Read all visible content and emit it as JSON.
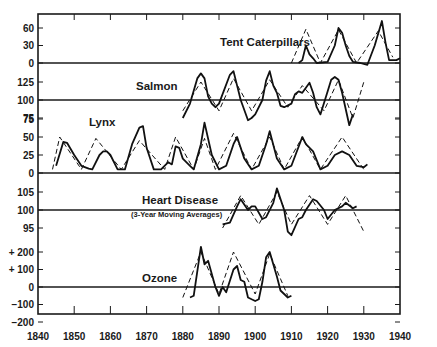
{
  "chart_data": {
    "type": "line",
    "title": "",
    "xlabel": "",
    "ylabel": "",
    "x_axis": {
      "range": [
        1840,
        1940
      ],
      "ticks": [
        1840,
        1850,
        1860,
        1870,
        1880,
        1890,
        1900,
        1910,
        1920,
        1930,
        1940
      ],
      "tick_labels": [
        "1840",
        "1850",
        "1860",
        "1870",
        "1880",
        "1890",
        "1900",
        "1910",
        "1920",
        "1930",
        "1940"
      ]
    },
    "grid": false,
    "legend": null,
    "line_styles": {
      "solid": "observed series",
      "dashed": "idealized cycle"
    },
    "panels": [
      {
        "name": "Tent Caterpillars",
        "label": "Tent Caterpillars",
        "y_ticks": [
          0,
          30,
          60
        ],
        "y_tick_labels": [
          "0",
          "30",
          "60"
        ],
        "baseline": 0,
        "series": [
          {
            "name": "observed",
            "style": "solid",
            "points": [
              [
                1912,
                0
              ],
              [
                1913,
                5
              ],
              [
                1914,
                30
              ],
              [
                1915,
                15
              ],
              [
                1916,
                8
              ],
              [
                1917,
                0
              ],
              [
                1920,
                2
              ],
              [
                1922,
                30
              ],
              [
                1923,
                60
              ],
              [
                1924,
                52
              ],
              [
                1925,
                30
              ],
              [
                1926,
                12
              ],
              [
                1927,
                2
              ],
              [
                1929,
                0
              ],
              [
                1931,
                -3
              ],
              [
                1933,
                30
              ],
              [
                1935,
                72
              ],
              [
                1936,
                35
              ],
              [
                1937,
                5
              ],
              [
                1939,
                5
              ],
              [
                1940,
                8
              ]
            ]
          },
          {
            "name": "cycle",
            "style": "dashed",
            "points": [
              [
                1910,
                0
              ],
              [
                1914,
                58
              ],
              [
                1918,
                0
              ],
              [
                1923,
                57
              ],
              [
                1928,
                0
              ],
              [
                1934,
                55
              ],
              [
                1938,
                10
              ]
            ]
          }
        ]
      },
      {
        "name": "Salmon",
        "label": "Salmon",
        "y_ticks": [
          75,
          100,
          125
        ],
        "y_tick_labels": [
          "75",
          "100",
          "125"
        ],
        "baseline": 100,
        "series": [
          {
            "name": "observed",
            "style": "solid",
            "points": [
              [
                1880,
                75
              ],
              [
                1882,
                95
              ],
              [
                1884,
                130
              ],
              [
                1885,
                137
              ],
              [
                1886,
                130
              ],
              [
                1887,
                105
              ],
              [
                1888,
                95
              ],
              [
                1889,
                90
              ],
              [
                1890,
                95
              ],
              [
                1893,
                135
              ],
              [
                1894,
                140
              ],
              [
                1895,
                120
              ],
              [
                1896,
                100
              ],
              [
                1898,
                72
              ],
              [
                1899,
                75
              ],
              [
                1900,
                80
              ],
              [
                1902,
                100
              ],
              [
                1903,
                127
              ],
              [
                1904,
                140
              ],
              [
                1905,
                120
              ],
              [
                1906,
                110
              ],
              [
                1907,
                92
              ],
              [
                1908,
                90
              ],
              [
                1910,
                95
              ],
              [
                1911,
                108
              ],
              [
                1912,
                112
              ],
              [
                1913,
                110
              ],
              [
                1914,
                117
              ],
              [
                1915,
                124
              ],
              [
                1916,
                110
              ],
              [
                1917,
                90
              ],
              [
                1918,
                80
              ],
              [
                1920,
                112
              ],
              [
                1921,
                128
              ],
              [
                1922,
                132
              ],
              [
                1923,
                128
              ],
              [
                1924,
                110
              ],
              [
                1926,
                65
              ],
              [
                1927,
                80
              ]
            ]
          },
          {
            "name": "cycle",
            "style": "dashed",
            "points": [
              [
                1880,
                85
              ],
              [
                1885,
                125
              ],
              [
                1890,
                85
              ],
              [
                1894,
                130
              ],
              [
                1899,
                85
              ],
              [
                1904,
                128
              ],
              [
                1909,
                90
              ],
              [
                1913,
                120
              ],
              [
                1919,
                85
              ],
              [
                1923,
                128
              ],
              [
                1927,
                75
              ],
              [
                1930,
                125
              ]
            ]
          }
        ]
      },
      {
        "name": "Lynx",
        "label": "Lynx",
        "y_ticks": [
          0,
          25,
          50,
          75
        ],
        "y_tick_labels": [
          "0",
          "25",
          "50",
          "75"
        ],
        "baseline": 0,
        "series": [
          {
            "name": "observed",
            "style": "solid",
            "points": [
              [
                1845,
                10
              ],
              [
                1847,
                43
              ],
              [
                1848,
                42
              ],
              [
                1850,
                25
              ],
              [
                1852,
                10
              ],
              [
                1854,
                6
              ],
              [
                1855,
                5
              ],
              [
                1857,
                25
              ],
              [
                1858,
                30
              ],
              [
                1859,
                30
              ],
              [
                1860,
                25
              ],
              [
                1862,
                5
              ],
              [
                1864,
                5
              ],
              [
                1866,
                40
              ],
              [
                1868,
                63
              ],
              [
                1869,
                65
              ],
              [
                1870,
                35
              ],
              [
                1872,
                5
              ],
              [
                1874,
                5
              ],
              [
                1876,
                15
              ],
              [
                1877,
                12
              ],
              [
                1878,
                37
              ],
              [
                1879,
                35
              ],
              [
                1880,
                20
              ],
              [
                1882,
                10
              ],
              [
                1883,
                5
              ],
              [
                1885,
                40
              ],
              [
                1886,
                70
              ],
              [
                1888,
                25
              ],
              [
                1890,
                5
              ],
              [
                1892,
                10
              ],
              [
                1894,
                40
              ],
              [
                1895,
                50
              ],
              [
                1897,
                20
              ],
              [
                1899,
                5
              ],
              [
                1901,
                10
              ],
              [
                1903,
                40
              ],
              [
                1904,
                58
              ],
              [
                1906,
                20
              ],
              [
                1908,
                5
              ],
              [
                1910,
                10
              ],
              [
                1913,
                50
              ],
              [
                1914,
                40
              ],
              [
                1916,
                30
              ],
              [
                1918,
                5
              ],
              [
                1920,
                10
              ],
              [
                1922,
                25
              ],
              [
                1924,
                30
              ],
              [
                1926,
                25
              ],
              [
                1928,
                10
              ],
              [
                1930,
                8
              ],
              [
                1931,
                12
              ]
            ]
          },
          {
            "name": "cycle",
            "style": "dashed",
            "points": [
              [
                1844,
                5
              ],
              [
                1846,
                50
              ],
              [
                1852,
                5
              ],
              [
                1856,
                48
              ],
              [
                1863,
                5
              ],
              [
                1868,
                45
              ],
              [
                1875,
                5
              ],
              [
                1878,
                50
              ],
              [
                1883,
                5
              ],
              [
                1886,
                48
              ],
              [
                1889,
                5
              ],
              [
                1894,
                55
              ],
              [
                1899,
                5
              ],
              [
                1904,
                50
              ],
              [
                1908,
                5
              ],
              [
                1913,
                50
              ],
              [
                1918,
                5
              ],
              [
                1924,
                50
              ],
              [
                1930,
                5
              ]
            ]
          }
        ]
      },
      {
        "name": "Heart Disease",
        "label": "Heart Disease",
        "sublabel": "(3-Year Moving Averages)",
        "y_ticks": [
          95,
          100,
          105
        ],
        "y_tick_labels": [
          "95",
          "100",
          "105"
        ],
        "baseline": 100,
        "series": [
          {
            "name": "observed",
            "style": "solid",
            "points": [
              [
                1891,
                96
              ],
              [
                1893,
                96.5
              ],
              [
                1895,
                101
              ],
              [
                1896,
                103
              ],
              [
                1898,
                100
              ],
              [
                1899,
                101
              ],
              [
                1900,
                101
              ],
              [
                1902,
                97.5
              ],
              [
                1903,
                98
              ],
              [
                1905,
                102
              ],
              [
                1906,
                106
              ],
              [
                1908,
                100
              ],
              [
                1909,
                94
              ],
              [
                1910,
                93
              ],
              [
                1912,
                97.5
              ],
              [
                1913,
                98
              ],
              [
                1914,
                100
              ],
              [
                1916,
                103
              ],
              [
                1917,
                102.5
              ],
              [
                1919,
                100
              ],
              [
                1920,
                97.5
              ],
              [
                1922,
                100
              ],
              [
                1924,
                101
              ],
              [
                1925,
                102
              ],
              [
                1927,
                100.5
              ],
              [
                1928,
                101
              ]
            ]
          },
          {
            "name": "cycle",
            "style": "dashed",
            "points": [
              [
                1891,
                95
              ],
              [
                1896,
                104
              ],
              [
                1901,
                96
              ],
              [
                1906,
                105
              ],
              [
                1910,
                96
              ],
              [
                1915,
                104
              ],
              [
                1920,
                96
              ],
              [
                1925,
                104
              ],
              [
                1930,
                94
              ]
            ]
          }
        ]
      },
      {
        "name": "Ozone",
        "label": "Ozone",
        "y_ticks": [
          -200,
          -100,
          0,
          100,
          200
        ],
        "y_tick_labels": [
          "−200",
          "−100",
          "0",
          "+ 100",
          "+ 200"
        ],
        "baseline": 0,
        "series": [
          {
            "name": "observed",
            "style": "solid",
            "points": [
              [
                1882,
                -60
              ],
              [
                1883,
                -50
              ],
              [
                1885,
                230
              ],
              [
                1886,
                130
              ],
              [
                1887,
                150
              ],
              [
                1889,
                0
              ],
              [
                1890,
                -50
              ],
              [
                1891,
                0
              ],
              [
                1892,
                -30
              ],
              [
                1894,
                100
              ],
              [
                1895,
                120
              ],
              [
                1896,
                40
              ],
              [
                1897,
                30
              ],
              [
                1898,
                -60
              ],
              [
                1899,
                -70
              ],
              [
                1900,
                -80
              ],
              [
                1901,
                -70
              ],
              [
                1902,
                30
              ],
              [
                1903,
                170
              ],
              [
                1904,
                200
              ],
              [
                1906,
                60
              ],
              [
                1907,
                -20
              ],
              [
                1909,
                -60
              ],
              [
                1910,
                -50
              ]
            ]
          },
          {
            "name": "cycle",
            "style": "dashed",
            "points": [
              [
                1880,
                -60
              ],
              [
                1885,
                200
              ],
              [
                1890,
                -40
              ],
              [
                1894,
                200
              ],
              [
                1900,
                -40
              ],
              [
                1904,
                190
              ],
              [
                1909,
                -50
              ]
            ]
          }
        ]
      }
    ]
  }
}
